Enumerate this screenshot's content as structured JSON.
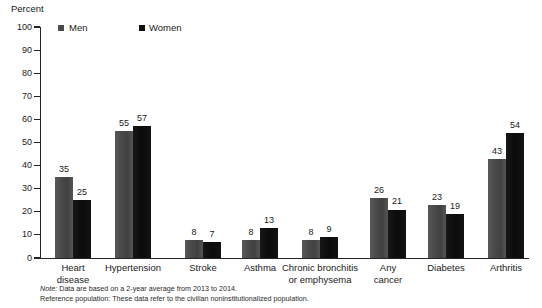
{
  "chart_data": {
    "type": "bar",
    "title": "",
    "subtitle": "",
    "xlabel": "",
    "ylabel": "Percent",
    "ylim": [
      0,
      100
    ],
    "ytick_step": 10,
    "yticks": [
      "100",
      "90",
      "80",
      "70",
      "60",
      "50",
      "40",
      "30",
      "20",
      "10",
      "0"
    ],
    "grid": false,
    "legend_position": "top-left",
    "categories": [
      "Heart\ndisease",
      "Hypertension",
      "Stroke",
      "Asthma",
      "Chronic bronchitis\nor emphysema",
      "Any\ncancer",
      "Diabetes",
      "Arthritis"
    ],
    "series": [
      {
        "name": "Men",
        "color": "#4b4b4b",
        "values": [
          35,
          55,
          8,
          8,
          8,
          26,
          23,
          43
        ]
      },
      {
        "name": "Women",
        "color": "#0d0d0d",
        "values": [
          25,
          57,
          7,
          13,
          9,
          21,
          19,
          54
        ]
      }
    ],
    "annotations": [
      "Note: Data are based on a 2-year average from 2013 to 2014.",
      "Reference population: These data refer to the civilian noninstitutionalized population."
    ]
  },
  "legend": {
    "items": [
      {
        "label": "Men",
        "swatch": "legend-swatch-men"
      },
      {
        "label": "Women",
        "swatch": "legend-swatch-women"
      }
    ]
  },
  "footnotes": {
    "note_prefix": "Note:",
    "note_text": " Data are based on a 2-year average from 2013 to 2014.",
    "reference_text": "Reference population: These data refer to the civilian noninstitutionalized population."
  },
  "colors": {
    "men": "#4b4b4b",
    "women": "#0d0d0d",
    "axis": "#242424",
    "text": "#1a1a1a",
    "background": "#ffffff"
  }
}
